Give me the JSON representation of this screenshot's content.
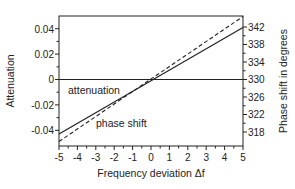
{
  "chart_data": {
    "type": "line",
    "title": "",
    "xlabel": "Frequency deviation Δf",
    "ylabel_left": "Attenuation",
    "ylabel_right": "Phase shift in degrees",
    "xlim": [
      -5,
      5
    ],
    "ylim_left": [
      -0.05,
      0.05
    ],
    "ylim_right": [
      315.5,
      344.5
    ],
    "x_ticks": [
      -5,
      -4,
      -3,
      -2,
      -1,
      0,
      1,
      2,
      3,
      4,
      5
    ],
    "y_left_ticks": [
      0.04,
      0.02,
      0,
      -0.02,
      -0.04
    ],
    "y_left_tick_labels": [
      "0.04",
      "0.02",
      "0",
      "-0.02",
      "-0.04"
    ],
    "y_right_ticks": [
      342,
      338,
      334,
      330,
      326,
      322,
      318
    ],
    "grid": false,
    "reference_line": {
      "axis": "left",
      "value": 0
    },
    "series": [
      {
        "name": "attenuation",
        "axis": "left",
        "style": "solid",
        "x": [
          -5,
          0,
          5
        ],
        "values": [
          -0.043,
          0,
          0.041
        ]
      },
      {
        "name": "phase shift",
        "axis": "right",
        "style": "dashed",
        "x": [
          -5,
          0,
          5
        ],
        "values": [
          315.8,
          330,
          344.3
        ]
      }
    ],
    "annotations": [
      {
        "text": "attenuation",
        "x": -3.7,
        "y_left": -0.008
      },
      {
        "text": "phase shift",
        "x": -2.2,
        "y_left": -0.035
      }
    ]
  },
  "labels": {
    "xlabel": "Frequency deviation Δf",
    "ylabel_left": "Attenuation",
    "ylabel_right": "Phase shift in degrees",
    "annot_attenuation": "attenuation",
    "annot_phase": "phase shift",
    "x_ticks": [
      "-5",
      "-4",
      "-3",
      "-2",
      "-1",
      "0",
      "1",
      "2",
      "3",
      "4",
      "5"
    ],
    "y_left": [
      "0.04",
      "0.02",
      "0",
      "-0.02",
      "-0.04"
    ],
    "y_right": [
      "342",
      "338",
      "334",
      "330",
      "326",
      "322",
      "318"
    ]
  }
}
